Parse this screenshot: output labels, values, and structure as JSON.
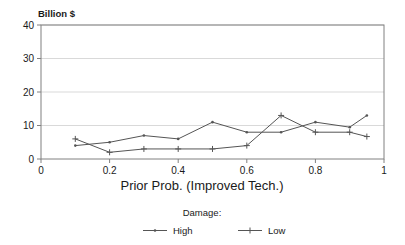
{
  "chart_data": {
    "type": "line",
    "title": "",
    "unit_label": "Billion $",
    "xlabel": "Prior Prob. (Improved Tech.)",
    "ylabel": "",
    "xlim": [
      0,
      1
    ],
    "ylim": [
      0,
      40
    ],
    "xticks": [
      "0",
      "0.2",
      "0.4",
      "0.6",
      "0.8",
      "1"
    ],
    "xtick_values": [
      0,
      0.2,
      0.4,
      0.6,
      0.8,
      1
    ],
    "yticks": [
      "0",
      "10",
      "20",
      "30",
      "40"
    ],
    "ytick_values": [
      0,
      10,
      20,
      30,
      40
    ],
    "grid": "horizontal",
    "legend_position": "bottom",
    "legend_title": "Damage:",
    "series": [
      {
        "name": "High",
        "marker": "dot",
        "color": "#555555",
        "x": [
          0.1,
          0.2,
          0.3,
          0.4,
          0.5,
          0.6,
          0.7,
          0.8,
          0.9,
          0.95
        ],
        "values": [
          4,
          5,
          7,
          6,
          11,
          8,
          8,
          11,
          9.5,
          13
        ]
      },
      {
        "name": "Low",
        "marker": "plus",
        "color": "#555555",
        "x": [
          0.1,
          0.2,
          0.3,
          0.4,
          0.5,
          0.6,
          0.7,
          0.8,
          0.9,
          0.95
        ],
        "values": [
          6,
          2,
          3,
          3,
          3,
          4,
          13,
          8,
          8,
          6.7
        ]
      }
    ]
  },
  "legend": {
    "title": "Damage:",
    "entries": [
      {
        "label": "High",
        "marker": "dot"
      },
      {
        "label": "Low",
        "marker": "plus"
      }
    ]
  },
  "axes": {
    "y_unit": "Billion $",
    "x_title": "Prior Prob. (Improved Tech.)"
  },
  "colors": {
    "line": "#555555",
    "frame": "#808080",
    "grid": "#d9d9d9",
    "text": "#1a1a1a",
    "background": "#ffffff"
  }
}
